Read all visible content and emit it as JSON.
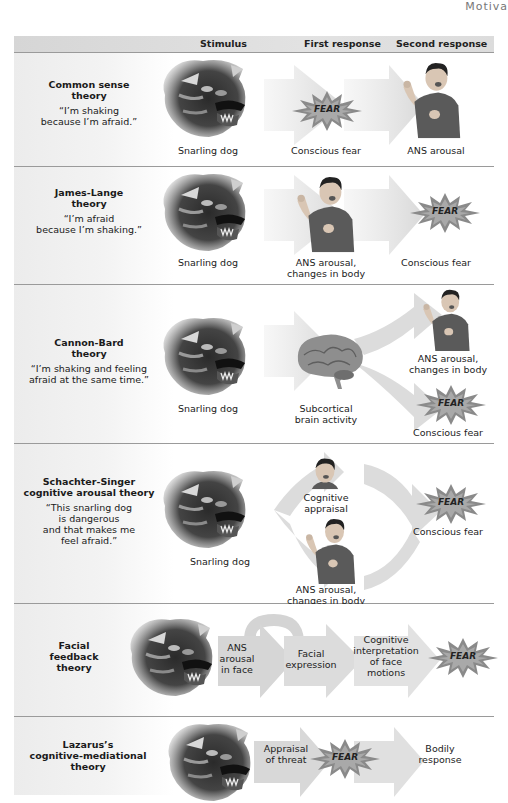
{
  "running_head": "Motiva",
  "header": {
    "col_stimulus": "Stimulus",
    "col_first": "First response",
    "col_second": "Second response"
  },
  "fear_label": "FEAR",
  "rows": [
    {
      "name": "Common sense theory",
      "name_lines": [
        "Common sense",
        "theory"
      ],
      "quote_lines": [
        "“I’m shaking",
        "because I’m afraid.”"
      ],
      "stimulus": "Snarling dog",
      "first": "Conscious fear",
      "second": "ANS arousal"
    },
    {
      "name": "James-Lange theory",
      "name_lines": [
        "James-Lange",
        "theory"
      ],
      "quote_lines": [
        "“I’m afraid",
        "because I’m shaking.”"
      ],
      "stimulus": "Snarling dog",
      "first_lines": [
        "ANS arousal,",
        "changes in body"
      ],
      "second": "Conscious fear"
    },
    {
      "name": "Cannon-Bard theory",
      "name_lines": [
        "Cannon-Bard",
        "theory"
      ],
      "quote_lines": [
        "“I’m shaking and feeling",
        "afraid at the same time.”"
      ],
      "stimulus": "Snarling dog",
      "first_lines": [
        "Subcortical",
        "brain activity"
      ],
      "second_a_lines": [
        "ANS arousal,",
        "changes in body"
      ],
      "second_b": "Conscious fear"
    },
    {
      "name": "Schachter-Singer cognitive arousal theory",
      "name_lines": [
        "Schachter-Singer",
        "cognitive arousal theory"
      ],
      "quote_lines": [
        "“This snarling dog",
        "is dangerous",
        "and that makes me",
        "feel afraid.”"
      ],
      "stimulus": "Snarling dog",
      "first_a_lines": [
        "Cognitive",
        "appraisal"
      ],
      "first_b_lines": [
        "ANS arousal,",
        "changes in body"
      ],
      "second": "Conscious fear"
    },
    {
      "name": "Facial feedback theory",
      "name_lines": [
        "Facial",
        "feedback",
        "theory"
      ],
      "steps": [
        {
          "lines": [
            "ANS",
            "arousal",
            "in face"
          ]
        },
        {
          "lines": [
            "Facial",
            "expression"
          ]
        },
        {
          "lines": [
            "Cognitive",
            "interpretation",
            "of face",
            "motions"
          ]
        }
      ]
    },
    {
      "name": "Lazarus's cognitive-mediational theory",
      "name_lines": [
        "Lazarus’s",
        "cognitive-mediational",
        "theory"
      ],
      "steps": [
        {
          "lines": [
            "Appraisal",
            "of threat"
          ]
        },
        {
          "lines": [
            "Bodily",
            "response"
          ]
        }
      ]
    }
  ],
  "colors": {
    "arrow": "#dcdcdc",
    "header_band": "#dadada",
    "separator": "#9a9a9a",
    "fear_burst": "#8a8a8a"
  }
}
